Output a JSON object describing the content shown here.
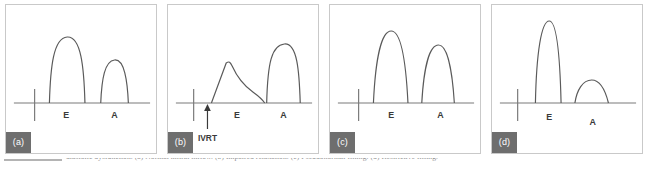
{
  "figure": {
    "background_color": "#ffffff",
    "border_color": "#c9c9c9",
    "chip_color": "#6e6e6e",
    "trace_color": "#5a5a5a",
    "baseline_color": "#7a7a7a",
    "label_color": "#3a3a3a"
  },
  "caption": {
    "fragment": "diastolic dysfunction. (a) Normal mitral inflow. (b) Impaired relaxation. (c) Pseudonormal filling. (d) Restrictive filling.",
    "rule_visible": true
  },
  "panels": [
    {
      "id": "a",
      "chip_label": "(a)",
      "pattern_name": "normal",
      "wave_labels": {
        "e": "E",
        "a": "A"
      },
      "annotation": null
    },
    {
      "id": "b",
      "chip_label": "(b)",
      "pattern_name": "impaired-relaxation",
      "wave_labels": {
        "e": "E",
        "a": "A"
      },
      "annotation": "IVRT"
    },
    {
      "id": "c",
      "chip_label": "(c)",
      "pattern_name": "pseudonormal",
      "wave_labels": {
        "e": "E",
        "a": "A"
      },
      "annotation": null
    },
    {
      "id": "d",
      "chip_label": "(d)",
      "pattern_name": "restrictive",
      "wave_labels": {
        "e": "E",
        "a": "A"
      },
      "annotation": null
    }
  ]
}
